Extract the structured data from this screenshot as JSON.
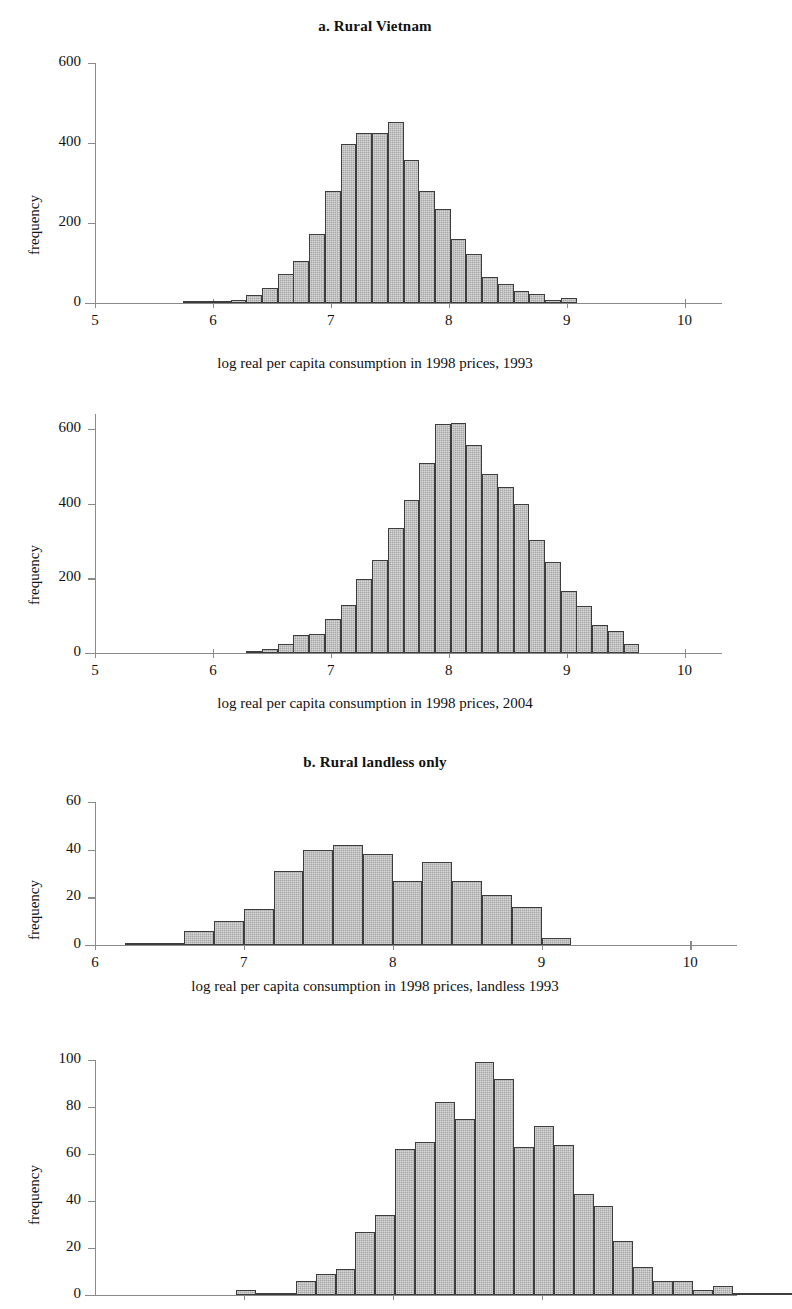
{
  "figure": {
    "section_titles": {
      "a": "a. Rural Vietnam",
      "b": "b. Rural landless only"
    },
    "ylabel": "frequency"
  },
  "chart_data": [
    {
      "id": "panel-a-1993",
      "type": "bar",
      "title": "a. Rural Vietnam",
      "xlabel": "log real per capita consumption in 1998 prices, 1993",
      "ylabel": "frequency",
      "xlim": [
        5,
        10.3
      ],
      "ylim": [
        0,
        600
      ],
      "xticks": [
        5,
        6,
        7,
        8,
        9,
        10
      ],
      "xtick_labels": [
        "5",
        "6",
        "7",
        "8",
        "9",
        "10"
      ],
      "yticks": [
        0,
        200,
        400,
        600
      ],
      "ytick_labels": [
        "0",
        "200",
        "400",
        "600"
      ],
      "grid": false,
      "legend": "none",
      "bin_width": 0.1333,
      "bin_starts": [
        5.75,
        5.883,
        6.017,
        6.15,
        6.283,
        6.417,
        6.55,
        6.683,
        6.817,
        6.95,
        7.083,
        7.217,
        7.35,
        7.483,
        7.617,
        7.75,
        7.883,
        8.017,
        8.15,
        8.283,
        8.417,
        8.55,
        8.683,
        8.817,
        8.95
      ],
      "values": [
        5,
        5,
        5,
        7,
        20,
        38,
        72,
        105,
        172,
        280,
        398,
        425,
        425,
        452,
        358,
        280,
        235,
        160,
        122,
        65,
        48,
        30,
        22,
        8,
        12
      ]
    },
    {
      "id": "panel-a-2004",
      "type": "bar",
      "title": "",
      "xlabel": "log real per capita consumption in 1998 prices, 2004",
      "ylabel": "frequency",
      "xlim": [
        5,
        10.3
      ],
      "ylim": [
        0,
        640
      ],
      "xticks": [
        5,
        6,
        7,
        8,
        9,
        10
      ],
      "xtick_labels": [
        "5",
        "6",
        "7",
        "8",
        "9",
        "10"
      ],
      "yticks": [
        0,
        200,
        400,
        600
      ],
      "ytick_labels": [
        "0",
        "200",
        "400",
        "600"
      ],
      "grid": false,
      "legend": "none",
      "bin_width": 0.1333,
      "bin_starts": [
        6.283,
        6.417,
        6.55,
        6.683,
        6.817,
        6.95,
        7.083,
        7.217,
        7.35,
        7.483,
        7.617,
        7.75,
        7.883,
        8.017,
        8.15,
        8.283,
        8.417,
        8.55,
        8.683,
        8.817,
        8.95,
        9.083,
        9.217,
        9.35,
        9.483
      ],
      "values": [
        6,
        12,
        25,
        48,
        52,
        92,
        128,
        198,
        248,
        335,
        410,
        508,
        612,
        615,
        558,
        478,
        445,
        398,
        302,
        245,
        165,
        125,
        75,
        58,
        25
      ]
    },
    {
      "id": "panel-b-landless-1993",
      "type": "bar",
      "title": "b. Rural landless only",
      "xlabel": "log real per capita consumption in 1998 prices, landless 1993",
      "ylabel": "frequency",
      "xlim": [
        6,
        10.3
      ],
      "ylim": [
        0,
        60
      ],
      "xticks": [
        6,
        7,
        8,
        9,
        10
      ],
      "xtick_labels": [
        "6",
        "7",
        "8",
        "9",
        "10"
      ],
      "yticks": [
        0,
        20,
        40,
        60
      ],
      "ytick_labels": [
        "0",
        "20",
        "40",
        "60"
      ],
      "grid": false,
      "legend": "none",
      "bin_width": 0.2,
      "bin_starts": [
        6.2,
        6.4,
        6.6,
        6.8,
        7.0,
        7.2,
        7.4,
        7.6,
        7.8,
        8.0,
        8.2,
        8.4,
        8.6,
        8.8,
        9.0
      ],
      "values": [
        1,
        1,
        6,
        10,
        15,
        31,
        40,
        42,
        38,
        27,
        35,
        27,
        21,
        16,
        3
      ]
    },
    {
      "id": "panel-b-landless-2004",
      "type": "bar",
      "title": "",
      "xlabel": "",
      "ylabel": "frequency",
      "xlim": [
        6,
        10.3
      ],
      "ylim": [
        0,
        100
      ],
      "xticks": [
        7,
        8,
        9
      ],
      "xtick_labels": [
        "",
        "",
        ""
      ],
      "yticks": [
        0,
        20,
        40,
        60,
        80,
        100
      ],
      "ytick_labels": [
        "0",
        "20",
        "40",
        "60",
        "80",
        "100"
      ],
      "grid": false,
      "legend": "none",
      "bin_width": 0.1333,
      "bin_starts": [
        6.95,
        7.083,
        7.217,
        7.35,
        7.483,
        7.617,
        7.75,
        7.883,
        8.017,
        8.15,
        8.283,
        8.417,
        8.55,
        8.683,
        8.817,
        8.95,
        9.083,
        9.217,
        9.35,
        9.483,
        9.617,
        9.75,
        9.883,
        10.017
      ],
      "values": [
        2,
        1,
        1,
        6,
        9,
        11,
        27,
        34,
        62,
        65,
        82,
        75,
        99,
        92,
        63,
        72,
        64,
        43,
        38,
        23,
        12,
        6,
        6,
        2
      ]
    }
  ],
  "extra_bars_panel4_tail": {
    "bin_starts": [
      10.15,
      10.283,
      10.417,
      10.55
    ],
    "values": [
      4,
      1,
      1,
      1
    ]
  }
}
